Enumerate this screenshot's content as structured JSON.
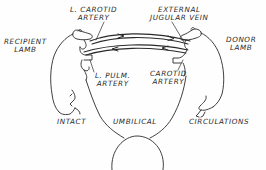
{
  "diagram": {
    "type": "cross-circulation illustration",
    "line_color": "#2a2a2a",
    "background": "#fefefe",
    "labels": {
      "recipient": [
        "RECIPIENT",
        "LAMB"
      ],
      "donor": [
        "DONOR",
        "LAMB"
      ],
      "l_carotid": [
        "L. CAROTID",
        "ARTERY"
      ],
      "ext_jugular": [
        "EXTERNAL",
        "JUGULAR VEIN"
      ],
      "l_pulm": [
        "L. PULM.",
        "ARTERY"
      ],
      "carotid": [
        "CAROTID",
        "ARTERY"
      ],
      "intact": "INTACT",
      "umbilical": "UMBILICAL",
      "circulations": "CIRCULATIONS"
    },
    "connections": [
      {
        "from": "Donor lamb external jugular vein",
        "to": "Recipient lamb L. carotid artery",
        "direction": "donor-to-recipient (upper tube, arrows right-to-left? shown pointing right)"
      },
      {
        "from": "Donor lamb carotid artery",
        "to": "Recipient lamb L. pulm. artery",
        "direction": "lower tube, arrows pointing left"
      }
    ],
    "bottom_element": "placenta / ewe (semicircle) with umbilical cords to both lambs"
  }
}
